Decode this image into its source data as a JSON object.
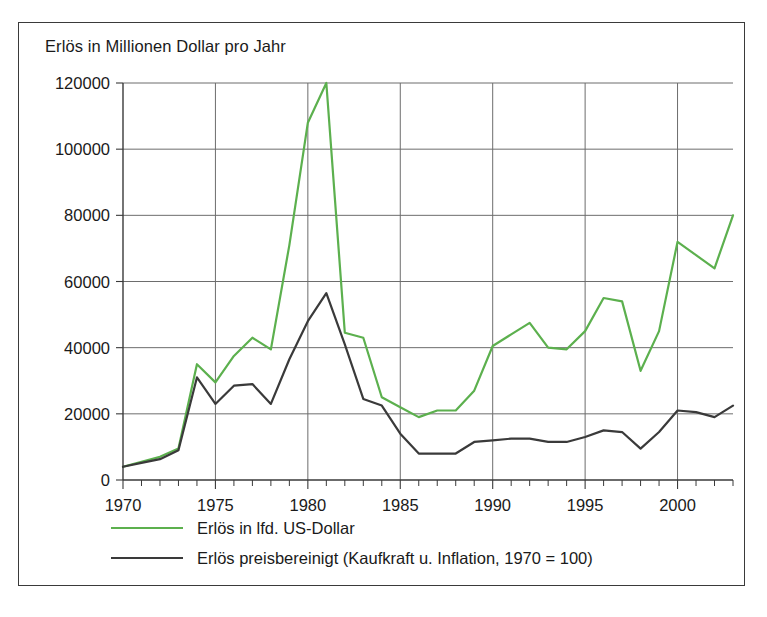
{
  "figure": {
    "title": "Erlös in Millionen Dollar pro Jahr"
  },
  "legend": {
    "items": [
      {
        "label": "Erlös in lfd. US-Dollar",
        "color": "#5cb04e"
      },
      {
        "label": "Erlös preisbereinigt (Kaufkraft u. Inflation, 1970 = 100)",
        "color": "#3a3a3a"
      }
    ]
  },
  "chart_data": {
    "type": "line",
    "title": "Erlös in Millionen Dollar pro Jahr",
    "xlabel": "",
    "ylabel": "",
    "xlim": [
      1970,
      2003
    ],
    "ylim": [
      0,
      120000
    ],
    "ytick_step": 20000,
    "yticks": [
      0,
      20000,
      40000,
      60000,
      80000,
      100000,
      120000
    ],
    "ytick_labels": [
      "0",
      "20000",
      "40000",
      "60000",
      "80000",
      "100000",
      "120000"
    ],
    "xticks_major": [
      1970,
      1975,
      1980,
      1985,
      1990,
      1995,
      2000
    ],
    "xtick_labels": [
      "1970",
      "1975",
      "1980",
      "1985",
      "1990",
      "1995",
      "2000"
    ],
    "xtick_minor_step": 1,
    "grid": "both",
    "legend_position": "below",
    "x": [
      1970,
      1971,
      1972,
      1973,
      1974,
      1975,
      1976,
      1977,
      1978,
      1979,
      1980,
      1981,
      1982,
      1983,
      1984,
      1985,
      1986,
      1987,
      1988,
      1989,
      1990,
      1991,
      1992,
      1993,
      1994,
      1995,
      1996,
      1997,
      1998,
      1999,
      2000,
      2001,
      2002,
      2003
    ],
    "series": [
      {
        "name": "Erlös in lfd. US-Dollar",
        "color": "#5cb04e",
        "values": [
          4000,
          5500,
          7000,
          9500,
          35000,
          29500,
          37500,
          43000,
          39500,
          71000,
          108000,
          120000,
          44500,
          43000,
          25000,
          22000,
          19000,
          21000,
          21000,
          27000,
          40500,
          44000,
          47500,
          40000,
          39500,
          45000,
          55000,
          54000,
          33000,
          45000,
          72000,
          68000,
          64000,
          80000
        ]
      },
      {
        "name": "Erlös preisbereinigt (Kaufkraft u. Inflation, 1970 = 100)",
        "color": "#3a3a3a",
        "values": [
          4000,
          5200,
          6300,
          9000,
          31000,
          23000,
          28500,
          29000,
          23000,
          36500,
          48000,
          56500,
          41000,
          24500,
          22500,
          14000,
          8000,
          8000,
          8000,
          11500,
          12000,
          12500,
          12500,
          11500,
          11500,
          13000,
          15000,
          14500,
          9500,
          14500,
          21000,
          20500,
          19000,
          22500
        ]
      }
    ]
  },
  "plot_geometry": {
    "left": 104,
    "right": 714,
    "top": 60,
    "bottom": 457
  }
}
